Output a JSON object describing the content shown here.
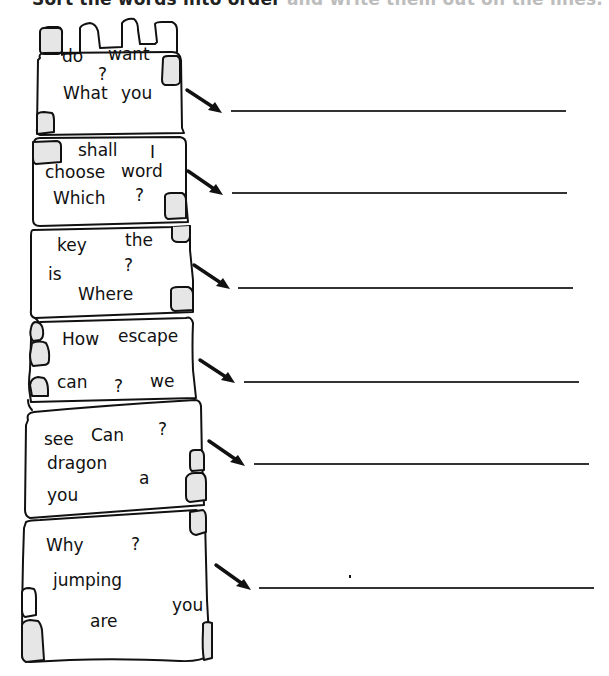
{
  "instruction": {
    "text_dark": "Sort the words into order",
    "text_faded": " and write them out on the lines."
  },
  "colors": {
    "ink": "#111111",
    "stone_fill": "#e6e6e6",
    "line": "#333333"
  },
  "blocks": [
    {
      "words": [
        {
          "text": "do",
          "x": 62,
          "y": 56
        },
        {
          "text": "want",
          "x": 108,
          "y": 56
        },
        {
          "text": "?",
          "x": 98,
          "y": 74
        },
        {
          "text": "What",
          "x": 63,
          "y": 93
        },
        {
          "text": "you",
          "x": 121,
          "y": 93
        }
      ],
      "answer": ""
    },
    {
      "words": [
        {
          "text": "shall",
          "x": 78,
          "y": 145
        },
        {
          "text": "I",
          "x": 150,
          "y": 145
        },
        {
          "text": "choose",
          "x": 45,
          "y": 166
        },
        {
          "text": "word",
          "x": 122,
          "y": 166
        },
        {
          "text": "Which",
          "x": 53,
          "y": 190
        },
        {
          "text": "?",
          "x": 135,
          "y": 188
        }
      ],
      "answer": ""
    },
    {
      "words": [
        {
          "text": "key",
          "x": 57,
          "y": 240
        },
        {
          "text": "the",
          "x": 125,
          "y": 235
        },
        {
          "text": "?",
          "x": 124,
          "y": 258
        },
        {
          "text": "is",
          "x": 48,
          "y": 269
        },
        {
          "text": "Where",
          "x": 78,
          "y": 286
        }
      ],
      "answer": ""
    },
    {
      "words": [
        {
          "text": "How",
          "x": 62,
          "y": 331
        },
        {
          "text": "escape",
          "x": 118,
          "y": 329
        },
        {
          "text": "can",
          "x": 57,
          "y": 377
        },
        {
          "text": "?",
          "x": 114,
          "y": 380
        },
        {
          "text": "we",
          "x": 150,
          "y": 375
        }
      ],
      "answer": ""
    },
    {
      "words": [
        {
          "text": "see",
          "x": 44,
          "y": 432
        },
        {
          "text": "Can",
          "x": 92,
          "y": 428
        },
        {
          "text": "?",
          "x": 158,
          "y": 424
        },
        {
          "text": "dragon",
          "x": 47,
          "y": 455
        },
        {
          "text": "a",
          "x": 139,
          "y": 472
        },
        {
          "text": "you",
          "x": 47,
          "y": 488
        }
      ],
      "answer": ""
    },
    {
      "words": [
        {
          "text": "Why",
          "x": 47,
          "y": 537
        },
        {
          "text": "?",
          "x": 131,
          "y": 537
        },
        {
          "text": "jumping",
          "x": 52,
          "y": 572
        },
        {
          "text": "you",
          "x": 173,
          "y": 597
        },
        {
          "text": "are",
          "x": 90,
          "y": 613
        }
      ],
      "answer": ""
    }
  ],
  "answer_lines": [
    {
      "x1": 231,
      "x2": 566,
      "y": 110
    },
    {
      "x1": 232,
      "x2": 567,
      "y": 192
    },
    {
      "x1": 238,
      "x2": 573,
      "y": 287
    },
    {
      "x1": 244,
      "x2": 579,
      "y": 381
    },
    {
      "x1": 254,
      "x2": 589,
      "y": 463
    },
    {
      "x1": 259,
      "x2": 594,
      "y": 587
    }
  ]
}
